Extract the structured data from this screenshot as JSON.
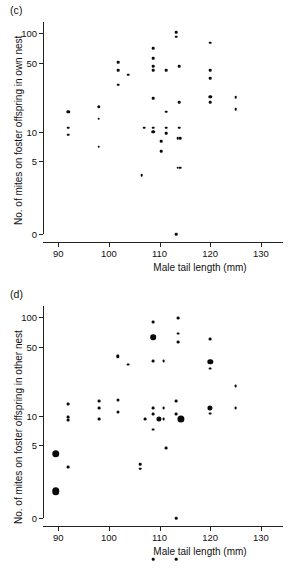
{
  "figure": {
    "panels": [
      {
        "label": "(c)",
        "name": "panel-c"
      },
      {
        "label": "(d)",
        "name": "panel-d"
      }
    ]
  },
  "chart_data": [
    {
      "type": "scatter",
      "panel": "(c)",
      "title": "",
      "xlabel": "Male tail length (mm)",
      "ylabel": "No. of mites on foster offspring in own nest",
      "xlim": [
        87,
        132
      ],
      "xticks": [
        90,
        100,
        110,
        120,
        130
      ],
      "xticklabels": [
        "90",
        "100",
        "110",
        "120",
        "130"
      ],
      "yscale": "log-with-zero",
      "yticks": [
        0,
        5,
        10,
        50,
        100
      ],
      "yticklabels": [
        "0",
        "5",
        "10",
        "50",
        "100"
      ],
      "grid": false,
      "legend": null,
      "points": [
        {
          "x": 92.0,
          "y": 16.0,
          "size": 3.4
        },
        {
          "x": 92.0,
          "y": 11.0,
          "size": 2.6
        },
        {
          "x": 92.0,
          "y": 9.3,
          "size": 2.6
        },
        {
          "x": 98.0,
          "y": 18.0,
          "size": 3.4
        },
        {
          "x": 98.0,
          "y": 13.5,
          "size": 2.6
        },
        {
          "x": 98.0,
          "y": 7.0,
          "size": 2.6
        },
        {
          "x": 101.8,
          "y": 51.0,
          "size": 2.6
        },
        {
          "x": 101.8,
          "y": 42.0,
          "size": 2.6
        },
        {
          "x": 101.8,
          "y": 30.0,
          "size": 2.6
        },
        {
          "x": 103.8,
          "y": 38.0,
          "size": 2.6
        },
        {
          "x": 106.5,
          "y": 3.6,
          "size": 2.6
        },
        {
          "x": 107.0,
          "y": 11.0,
          "size": 2.6
        },
        {
          "x": 108.8,
          "y": 70.0,
          "size": 2.6
        },
        {
          "x": 108.8,
          "y": 56.0,
          "size": 2.6
        },
        {
          "x": 108.8,
          "y": 46.0,
          "size": 2.6
        },
        {
          "x": 108.8,
          "y": 42.0,
          "size": 2.6
        },
        {
          "x": 108.8,
          "y": 22.0,
          "size": 2.6
        },
        {
          "x": 108.8,
          "y": 11.0,
          "size": 2.6
        },
        {
          "x": 108.8,
          "y": 10.0,
          "size": 3.6
        },
        {
          "x": 110.3,
          "y": 8.0,
          "size": 2.6
        },
        {
          "x": 110.3,
          "y": 6.3,
          "size": 2.6
        },
        {
          "x": 111.3,
          "y": 42.0,
          "size": 2.6
        },
        {
          "x": 111.3,
          "y": 16.0,
          "size": 2.6
        },
        {
          "x": 111.3,
          "y": 11.0,
          "size": 2.6
        },
        {
          "x": 111.3,
          "y": 9.6,
          "size": 2.6
        },
        {
          "x": 113.3,
          "y": 103.0,
          "size": 2.6
        },
        {
          "x": 113.3,
          "y": 92.0,
          "size": 2.6
        },
        {
          "x": 113.3,
          "y": 0.0,
          "size": 2.6
        },
        {
          "x": 113.6,
          "y": 8.6,
          "size": 2.6
        },
        {
          "x": 114.1,
          "y": 8.6,
          "size": 2.6
        },
        {
          "x": 113.6,
          "y": 4.3,
          "size": 2.6
        },
        {
          "x": 114.1,
          "y": 4.3,
          "size": 2.6
        },
        {
          "x": 113.9,
          "y": 46.0,
          "size": 2.6
        },
        {
          "x": 113.9,
          "y": 20.0,
          "size": 2.6
        },
        {
          "x": 113.9,
          "y": 11.0,
          "size": 2.6
        },
        {
          "x": 120.0,
          "y": 80.0,
          "size": 2.6
        },
        {
          "x": 120.0,
          "y": 42.0,
          "size": 2.6
        },
        {
          "x": 120.0,
          "y": 35.0,
          "size": 2.6
        },
        {
          "x": 120.0,
          "y": 22.5,
          "size": 3.4
        },
        {
          "x": 120.0,
          "y": 20.0,
          "size": 2.6
        },
        {
          "x": 125.0,
          "y": 22.5,
          "size": 2.6
        },
        {
          "x": 125.0,
          "y": 17.0,
          "size": 2.6
        }
      ]
    },
    {
      "type": "scatter",
      "panel": "(d)",
      "title": "",
      "xlabel": "Male tail length (mm)",
      "ylabel": "No. of mites on foster offspring in other nest",
      "xlim": [
        87,
        132
      ],
      "xticks": [
        90,
        100,
        110,
        120,
        130
      ],
      "xticklabels": [
        "90",
        "100",
        "110",
        "120",
        "130"
      ],
      "yscale": "log-with-zero",
      "yticks": [
        0,
        5,
        10,
        50,
        100
      ],
      "yticklabels": [
        "0",
        "5",
        "10",
        "50",
        "100"
      ],
      "grid": false,
      "legend": null,
      "points": [
        {
          "x": 89.5,
          "y": 4.1,
          "size": 7.5
        },
        {
          "x": 89.5,
          "y": 1.7,
          "size": 7.5
        },
        {
          "x": 92.0,
          "y": 13.0,
          "size": 2.8
        },
        {
          "x": 92.0,
          "y": 9.7,
          "size": 2.8
        },
        {
          "x": 92.0,
          "y": 9.0,
          "size": 2.8
        },
        {
          "x": 92.0,
          "y": 3.0,
          "size": 2.8
        },
        {
          "x": 98.0,
          "y": 14.0,
          "size": 2.8
        },
        {
          "x": 98.0,
          "y": 12.0,
          "size": 2.8
        },
        {
          "x": 98.0,
          "y": 9.3,
          "size": 2.8
        },
        {
          "x": 101.8,
          "y": 40.0,
          "size": 3.4
        },
        {
          "x": 101.8,
          "y": 14.5,
          "size": 3.0
        },
        {
          "x": 101.8,
          "y": 11.0,
          "size": 3.0
        },
        {
          "x": 103.8,
          "y": 33.0,
          "size": 2.8
        },
        {
          "x": 106.2,
          "y": 3.2,
          "size": 2.6
        },
        {
          "x": 106.2,
          "y": 2.9,
          "size": 2.6
        },
        {
          "x": 107.2,
          "y": 9.3,
          "size": 2.8
        },
        {
          "x": 108.8,
          "y": 90.0,
          "size": 2.8
        },
        {
          "x": 108.8,
          "y": 63.0,
          "size": 5.6
        },
        {
          "x": 108.8,
          "y": 36.0,
          "size": 2.8
        },
        {
          "x": 108.8,
          "y": 12.0,
          "size": 2.8
        },
        {
          "x": 108.8,
          "y": 10.3,
          "size": 2.8
        },
        {
          "x": 108.8,
          "y": 7.2,
          "size": 2.8
        },
        {
          "x": 108.8,
          "y": 0.35,
          "size": 2.6
        },
        {
          "x": 109.8,
          "y": 9.3,
          "size": 5.2
        },
        {
          "x": 110.8,
          "y": 36.0,
          "size": 2.8
        },
        {
          "x": 110.8,
          "y": 12.0,
          "size": 2.8
        },
        {
          "x": 110.8,
          "y": 9.3,
          "size": 2.8
        },
        {
          "x": 111.3,
          "y": 4.7,
          "size": 2.8
        },
        {
          "x": 113.3,
          "y": 14.0,
          "size": 2.8
        },
        {
          "x": 113.3,
          "y": 10.3,
          "size": 2.8
        },
        {
          "x": 113.3,
          "y": 0.35,
          "size": 2.6
        },
        {
          "x": 113.3,
          "y": 0.0,
          "size": 2.6
        },
        {
          "x": 113.6,
          "y": 98.0,
          "size": 2.8
        },
        {
          "x": 113.6,
          "y": 68.0,
          "size": 2.8
        },
        {
          "x": 113.6,
          "y": 56.0,
          "size": 2.8
        },
        {
          "x": 114.2,
          "y": 9.3,
          "size": 7.2
        },
        {
          "x": 120.0,
          "y": 60.0,
          "size": 2.8
        },
        {
          "x": 120.0,
          "y": 35.0,
          "size": 5.4
        },
        {
          "x": 120.0,
          "y": 30.0,
          "size": 2.8
        },
        {
          "x": 120.0,
          "y": 12.0,
          "size": 5.2
        },
        {
          "x": 120.0,
          "y": 10.5,
          "size": 2.8
        },
        {
          "x": 125.0,
          "y": 20.0,
          "size": 2.8
        },
        {
          "x": 125.0,
          "y": 12.0,
          "size": 2.8
        }
      ]
    }
  ]
}
